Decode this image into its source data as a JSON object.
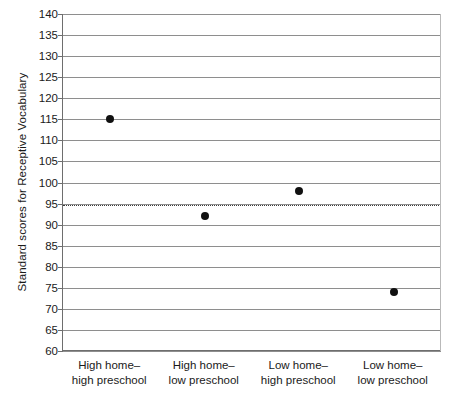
{
  "chart_data": {
    "type": "scatter",
    "title": "",
    "xlabel": "",
    "ylabel": "Standard scores for Receptive Vocabulary",
    "categories": [
      "High home–\nhigh preschool",
      "High home–\nlow preschool",
      "Low home–\nhigh preschool",
      "Low home–\nlow preschool"
    ],
    "category_lines": [
      [
        "High home–",
        "high preschool"
      ],
      [
        "High home–",
        "low preschool"
      ],
      [
        "Low home–",
        "high preschool"
      ],
      [
        "Low home–",
        "low preschool"
      ]
    ],
    "values": [
      115,
      92,
      98,
      74
    ],
    "ylim": [
      60,
      140
    ],
    "ytick_step": 5,
    "yticks": [
      140,
      135,
      130,
      125,
      120,
      115,
      110,
      105,
      100,
      95,
      90,
      85,
      80,
      75,
      70,
      65,
      60
    ],
    "grid": true,
    "grid_axis": "y",
    "legend": null,
    "reference_line": {
      "value": 95,
      "style": "dotted",
      "label": ""
    },
    "colors": {
      "marker": "#111111",
      "gridline": "#8e8e8e",
      "axis": "#6e6e6e",
      "reference_line": "#3a3a3a",
      "background": "#ffffff"
    }
  }
}
